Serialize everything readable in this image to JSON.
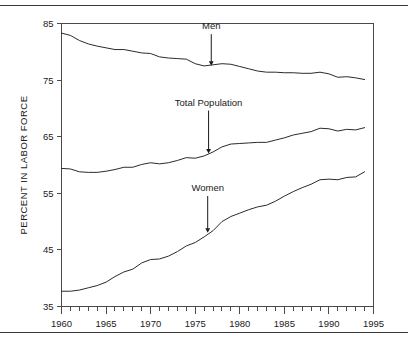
{
  "figure": {
    "has_top_rule": true,
    "has_bottom_rule": true,
    "background": "#ffffff",
    "line_color": "#2b2b2b",
    "axis_color": "#4a4a4a"
  },
  "chart_data": {
    "type": "line",
    "title": "",
    "xlabel": "",
    "ylabel": "PERCENT IN LABOR FORCE",
    "xlim": [
      1960,
      1995
    ],
    "ylim": [
      35,
      85
    ],
    "xticks": [
      1960,
      1965,
      1970,
      1975,
      1980,
      1985,
      1990,
      1995
    ],
    "xtick_labels": [
      "1960",
      "1965",
      "1970",
      "1975",
      "1980",
      "1985",
      "1990",
      "1995"
    ],
    "yticks": [
      35,
      45,
      55,
      65,
      75,
      85
    ],
    "ytick_labels": [
      "35",
      "45",
      "55",
      "65",
      "75",
      "85"
    ],
    "minor_xtick_interval": 1,
    "grid": false,
    "legend": "inline-annotations",
    "x": [
      1960,
      1961,
      1962,
      1963,
      1964,
      1965,
      1966,
      1967,
      1968,
      1969,
      1970,
      1971,
      1972,
      1973,
      1974,
      1975,
      1976,
      1977,
      1978,
      1979,
      1980,
      1981,
      1982,
      1983,
      1984,
      1985,
      1986,
      1987,
      1988,
      1989,
      1990,
      1991,
      1992,
      1993,
      1994
    ],
    "series": [
      {
        "name": "Men",
        "values": [
          83.3,
          82.9,
          82.0,
          81.4,
          81.0,
          80.7,
          80.4,
          80.4,
          80.1,
          79.8,
          79.7,
          79.1,
          78.9,
          78.8,
          78.7,
          77.9,
          77.5,
          77.7,
          77.9,
          77.8,
          77.4,
          77.0,
          76.6,
          76.4,
          76.4,
          76.3,
          76.3,
          76.2,
          76.2,
          76.4,
          76.1,
          75.5,
          75.6,
          75.4,
          75.1
        ]
      },
      {
        "name": "Total Population",
        "values": [
          59.4,
          59.3,
          58.8,
          58.7,
          58.7,
          58.9,
          59.2,
          59.6,
          59.6,
          60.1,
          60.4,
          60.2,
          60.4,
          60.8,
          61.3,
          61.2,
          61.6,
          62.3,
          63.2,
          63.7,
          63.8,
          63.9,
          64.0,
          64.0,
          64.4,
          64.8,
          65.3,
          65.6,
          65.9,
          66.5,
          66.4,
          66.0,
          66.3,
          66.2,
          66.6
        ]
      },
      {
        "name": "Women",
        "values": [
          37.7,
          37.7,
          37.9,
          38.3,
          38.7,
          39.3,
          40.3,
          41.1,
          41.6,
          42.7,
          43.3,
          43.4,
          43.9,
          44.7,
          45.7,
          46.3,
          47.3,
          48.4,
          50.0,
          50.9,
          51.5,
          52.1,
          52.6,
          52.9,
          53.6,
          54.5,
          55.3,
          56.0,
          56.6,
          57.4,
          57.5,
          57.4,
          57.8,
          57.9,
          58.8
        ]
      }
    ],
    "annotations": [
      {
        "text": "Men",
        "x": 1976.8,
        "y_label": 84.0,
        "y_target": 77.6
      },
      {
        "text": "Total Population",
        "x": 1976.5,
        "y_label": 70.5,
        "y_target": 62.1
      },
      {
        "text": "Women",
        "x": 1976.4,
        "y_label": 55.4,
        "y_target": 48.1
      }
    ]
  }
}
